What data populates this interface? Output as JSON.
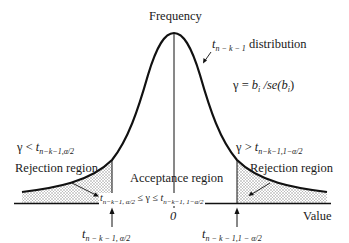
{
  "diagram": {
    "title_axis": "Frequency",
    "distribution_label": {
      "symbol": "t",
      "subscript": "n − k − 1",
      "text": "distribution"
    },
    "statistic": "γ = bᵢ / se(bᵢ)",
    "statistic_parts": {
      "lhs": "γ = ",
      "b": "b",
      "i": "i",
      "mid": " /se(",
      "b2": "b",
      "i2": "i",
      "end": ")"
    },
    "left_condition": {
      "prefix": "γ < ",
      "symbol": "t",
      "subscript": "n−k−1,α/2"
    },
    "right_condition": {
      "prefix": "γ > ",
      "symbol": "t",
      "subscript": "n−k−1,1−α/2"
    },
    "rejection_left": "Rejection region",
    "rejection_right": "Rejection region",
    "acceptance": "Acceptance region",
    "acceptance_inequality": {
      "left_symbol": "t",
      "left_sub": "n−k−1, α/2",
      "middle": " ≤ γ ≤ ",
      "right_symbol": "t",
      "right_sub": "n−k−1, 1−α/2"
    },
    "zero": "0",
    "x_axis_label": "Value",
    "critical_left": {
      "symbol": "t",
      "subscript": "n − k − 1, α/2"
    },
    "critical_right": {
      "symbol": "t",
      "subscript": "n − k − 1,1 − α/2"
    },
    "colors": {
      "ink": "#1a1a1a",
      "shade": "#d9d9d9"
    }
  }
}
